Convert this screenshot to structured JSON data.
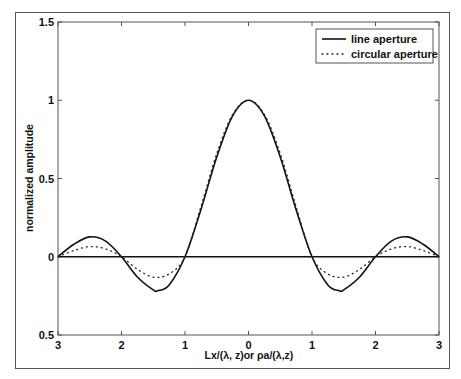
{
  "chart_data": {
    "type": "line",
    "title": "",
    "xlabel": "Lx/(λ, z)or   ρa/(λ,z)",
    "ylabel": "normalized amplitude",
    "xlim": [
      -3,
      3
    ],
    "ylim": [
      -0.5,
      1.5
    ],
    "x_ticks": [
      -3,
      -2,
      -1,
      0,
      1,
      2,
      3
    ],
    "x_tick_labels": [
      "3",
      "2",
      "1",
      "0",
      "1",
      "2",
      "3"
    ],
    "y_ticks": [
      -0.5,
      0,
      0.5,
      1,
      1.5
    ],
    "y_tick_labels": [
      "0.5",
      "0",
      "0.5",
      "1",
      "1.5"
    ],
    "grid": false,
    "legend_position": "upper right",
    "series": [
      {
        "name": "line aperture",
        "style": "solid",
        "x": [
          -3,
          -2.75,
          -2.5,
          -2.25,
          -2,
          -1.75,
          -1.5,
          -1.43,
          -1.25,
          -1,
          -0.75,
          -0.5,
          -0.25,
          0,
          0.25,
          0.5,
          0.75,
          1,
          1.25,
          1.43,
          1.5,
          1.75,
          2,
          2.25,
          2.5,
          2.75,
          3
        ],
        "values": [
          0,
          0.08,
          0.127,
          0.1,
          0,
          -0.129,
          -0.212,
          -0.217,
          -0.18,
          0,
          0.3,
          0.637,
          0.9,
          1,
          0.9,
          0.637,
          0.3,
          0,
          -0.18,
          -0.217,
          -0.212,
          -0.129,
          0,
          0.1,
          0.127,
          0.08,
          0
        ]
      },
      {
        "name": "circular aperture",
        "style": "dotted",
        "x": [
          -3,
          -2.75,
          -2.5,
          -2.25,
          -2,
          -1.75,
          -1.5,
          -1.25,
          -1,
          -0.75,
          -0.5,
          -0.25,
          0,
          0.25,
          0.5,
          0.75,
          1,
          1.25,
          1.5,
          1.75,
          2,
          2.25,
          2.5,
          2.75,
          3
        ],
        "values": [
          0,
          0.04,
          0.065,
          0.05,
          0,
          -0.08,
          -0.13,
          -0.11,
          0,
          0.32,
          0.66,
          0.91,
          1,
          0.91,
          0.66,
          0.32,
          0,
          -0.11,
          -0.13,
          -0.08,
          0,
          0.05,
          0.065,
          0.04,
          0
        ]
      }
    ]
  },
  "legend": {
    "items": [
      {
        "label": "line aperture",
        "style": "solid"
      },
      {
        "label": "circular aperture",
        "style": "dotted"
      }
    ]
  },
  "colors": {
    "line": "#111111",
    "frame": "#555555"
  }
}
